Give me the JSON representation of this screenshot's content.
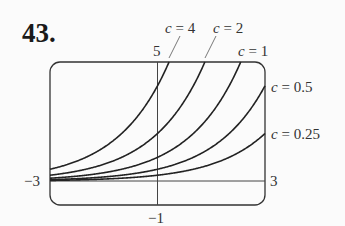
{
  "problem_number": "43.",
  "chart_data": {
    "type": "line",
    "title": "",
    "function": "y = c·2^x",
    "xlim": [
      -3,
      3
    ],
    "ylim": [
      -1,
      5
    ],
    "tick_labels": {
      "x_min": "−3",
      "x_max": "3",
      "y_min": "−1",
      "y_max": "5"
    },
    "grid": false,
    "series": [
      {
        "name": "c = 4",
        "c": 4,
        "x": [
          -3,
          -2,
          -1,
          0,
          0.32
        ],
        "y": [
          0.5,
          1,
          2,
          4,
          5
        ]
      },
      {
        "name": "c = 2",
        "c": 2,
        "x": [
          -3,
          -2,
          -1,
          0,
          1,
          1.32
        ],
        "y": [
          0.25,
          0.5,
          1,
          2,
          4,
          5
        ]
      },
      {
        "name": "c = 1",
        "c": 1,
        "x": [
          -3,
          -2,
          -1,
          0,
          1,
          2,
          2.32
        ],
        "y": [
          0.125,
          0.25,
          0.5,
          1,
          2,
          4,
          5
        ]
      },
      {
        "name": "c = 0.5",
        "c": 0.5,
        "x": [
          -3,
          -2,
          -1,
          0,
          1,
          2,
          3
        ],
        "y": [
          0.0625,
          0.125,
          0.25,
          0.5,
          1,
          2,
          4
        ]
      },
      {
        "name": "c = 0.25",
        "c": 0.25,
        "x": [
          -3,
          -2,
          -1,
          0,
          1,
          2,
          3
        ],
        "y": [
          0.03125,
          0.0625,
          0.125,
          0.25,
          0.5,
          1,
          2
        ]
      }
    ],
    "labels": {
      "c4": {
        "var": "c",
        "eq": " = 4"
      },
      "c2": {
        "var": "c",
        "eq": " = 2"
      },
      "c1": {
        "var": "c",
        "eq": " = 1"
      },
      "c05": {
        "var": "c",
        "eq": " = 0.5"
      },
      "c025": {
        "var": "c",
        "eq": " = 0.25"
      }
    }
  }
}
